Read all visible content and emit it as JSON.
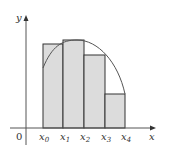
{
  "diagram": {
    "type": "riemann-sum-left-endpoints",
    "axes": {
      "x_label": "x",
      "y_label": "y",
      "origin_label": "0"
    },
    "partition_labels": [
      {
        "base": "x",
        "sub": "0"
      },
      {
        "base": "x",
        "sub": "1"
      },
      {
        "base": "x",
        "sub": "2"
      },
      {
        "base": "x",
        "sub": "3"
      },
      {
        "base": "x",
        "sub": "4"
      }
    ],
    "rectangles": [
      {
        "x0": 43,
        "x1": 63,
        "top": 44
      },
      {
        "x0": 63,
        "x1": 84,
        "top": 40
      },
      {
        "x0": 84,
        "x1": 105,
        "top": 55
      },
      {
        "x0": 105,
        "x1": 125,
        "top": 94
      }
    ],
    "colors": {
      "fill": "#dcdcdc",
      "stroke": "#333333",
      "curve": "#555555",
      "axis": "#555555"
    }
  }
}
